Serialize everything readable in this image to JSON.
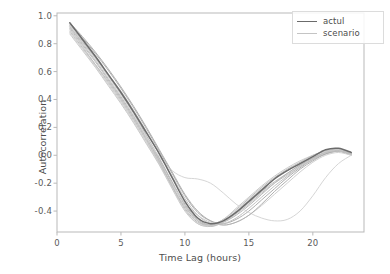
{
  "chart_data": {
    "type": "line",
    "title": "",
    "xlabel": "Time Lag (hours)",
    "ylabel": "Autocorrelation",
    "xlim": [
      0,
      24
    ],
    "ylim": [
      -0.55,
      1.02
    ],
    "xticks": [
      "0",
      "5",
      "10",
      "15",
      "20"
    ],
    "xtick_values": [
      0,
      5,
      10,
      15,
      20
    ],
    "yticks": [
      "1.0",
      "0.8",
      "0.6",
      "0.4",
      "0.2",
      "0.0",
      "-0.2",
      "-0.4"
    ],
    "ytick_values": [
      1.0,
      0.8,
      0.6,
      0.4,
      0.2,
      0.0,
      -0.2,
      -0.4
    ],
    "grid": false,
    "legend_position": "upper right",
    "legend": [
      {
        "name": "actul",
        "color": "#6b6b6b"
      },
      {
        "name": "scenario",
        "color": "#c4c4c4"
      }
    ],
    "x": [
      1,
      2,
      3,
      4,
      5,
      6,
      7,
      8,
      9,
      10,
      11,
      12,
      13,
      14,
      15,
      16,
      17,
      18,
      19,
      20,
      21,
      22,
      23
    ],
    "series": [
      {
        "name": "actul",
        "color": "#6b6b6b",
        "width": 1.5,
        "values": [
          0.95,
          0.83,
          0.71,
          0.58,
          0.45,
          0.31,
          0.16,
          0.01,
          -0.16,
          -0.33,
          -0.45,
          -0.49,
          -0.47,
          -0.41,
          -0.33,
          -0.25,
          -0.17,
          -0.11,
          -0.06,
          -0.01,
          0.04,
          0.05,
          0.02
        ]
      },
      {
        "name": "scenario",
        "color": "#bdbdbd",
        "width": 1.0,
        "values": [
          0.92,
          0.8,
          0.68,
          0.55,
          0.42,
          0.28,
          0.13,
          -0.03,
          -0.2,
          -0.36,
          -0.47,
          -0.5,
          -0.47,
          -0.41,
          -0.34,
          -0.26,
          -0.19,
          -0.13,
          -0.07,
          -0.02,
          0.02,
          0.03,
          0.01
        ]
      },
      {
        "name": "scenario",
        "color": "#b5b5b5",
        "width": 1.0,
        "values": [
          0.93,
          0.82,
          0.7,
          0.57,
          0.44,
          0.3,
          0.14,
          -0.02,
          -0.19,
          -0.35,
          -0.46,
          -0.5,
          -0.48,
          -0.43,
          -0.36,
          -0.28,
          -0.2,
          -0.13,
          -0.07,
          -0.02,
          0.02,
          0.03,
          0.0
        ]
      },
      {
        "name": "scenario",
        "color": "#c8c8c8",
        "width": 1.0,
        "values": [
          0.9,
          0.78,
          0.65,
          0.52,
          0.39,
          0.25,
          0.1,
          -0.06,
          -0.23,
          -0.39,
          -0.49,
          -0.51,
          -0.47,
          -0.4,
          -0.32,
          -0.24,
          -0.17,
          -0.11,
          -0.06,
          -0.01,
          0.03,
          0.04,
          0.01
        ]
      },
      {
        "name": "scenario",
        "color": "#aeaeae",
        "width": 1.0,
        "values": [
          0.94,
          0.84,
          0.73,
          0.61,
          0.48,
          0.34,
          0.19,
          0.03,
          -0.13,
          -0.29,
          -0.41,
          -0.47,
          -0.49,
          -0.46,
          -0.4,
          -0.32,
          -0.24,
          -0.16,
          -0.09,
          -0.03,
          0.01,
          0.03,
          0.01
        ]
      },
      {
        "name": "scenario",
        "color": "#d0d0d0",
        "width": 1.0,
        "values": [
          0.88,
          0.76,
          0.64,
          0.51,
          0.38,
          0.24,
          0.09,
          -0.06,
          -0.21,
          -0.34,
          -0.43,
          -0.48,
          -0.5,
          -0.48,
          -0.43,
          -0.36,
          -0.28,
          -0.2,
          -0.12,
          -0.05,
          0.0,
          0.02,
          0.0
        ]
      },
      {
        "name": "scenario",
        "color": "#bcbcbc",
        "width": 1.0,
        "values": [
          0.91,
          0.79,
          0.67,
          0.54,
          0.41,
          0.27,
          0.12,
          -0.04,
          -0.22,
          -0.38,
          -0.48,
          -0.5,
          -0.46,
          -0.39,
          -0.31,
          -0.23,
          -0.16,
          -0.1,
          -0.05,
          0.0,
          0.03,
          0.04,
          0.02
        ]
      },
      {
        "name": "scenario",
        "color": "#d6d6d6",
        "width": 1.0,
        "values": [
          0.93,
          0.81,
          0.69,
          0.56,
          0.43,
          0.29,
          0.13,
          -0.01,
          -0.11,
          -0.16,
          -0.17,
          -0.2,
          -0.27,
          -0.35,
          -0.41,
          -0.45,
          -0.47,
          -0.46,
          -0.4,
          -0.29,
          -0.16,
          -0.06,
          0.0
        ]
      },
      {
        "name": "scenario",
        "color": "#c0c0c0",
        "width": 1.0,
        "values": [
          0.89,
          0.77,
          0.65,
          0.53,
          0.4,
          0.26,
          0.11,
          -0.05,
          -0.22,
          -0.37,
          -0.47,
          -0.51,
          -0.48,
          -0.42,
          -0.35,
          -0.27,
          -0.2,
          -0.14,
          -0.08,
          -0.03,
          0.01,
          0.03,
          0.01
        ]
      },
      {
        "name": "scenario",
        "color": "#b0b0b0",
        "width": 1.0,
        "values": [
          0.95,
          0.85,
          0.74,
          0.62,
          0.49,
          0.35,
          0.2,
          0.04,
          -0.12,
          -0.28,
          -0.4,
          -0.47,
          -0.5,
          -0.48,
          -0.43,
          -0.35,
          -0.26,
          -0.18,
          -0.1,
          -0.04,
          0.01,
          0.03,
          0.01
        ]
      },
      {
        "name": "scenario",
        "color": "#cacaca",
        "width": 1.0,
        "values": [
          0.87,
          0.75,
          0.63,
          0.5,
          0.37,
          0.23,
          0.08,
          -0.07,
          -0.24,
          -0.4,
          -0.49,
          -0.5,
          -0.46,
          -0.38,
          -0.3,
          -0.22,
          -0.15,
          -0.09,
          -0.04,
          0.0,
          0.03,
          0.04,
          0.02
        ]
      },
      {
        "name": "scenario",
        "color": "#c2c2c2",
        "width": 1.0,
        "values": [
          0.92,
          0.81,
          0.7,
          0.58,
          0.46,
          0.32,
          0.17,
          0.01,
          -0.15,
          -0.31,
          -0.43,
          -0.49,
          -0.49,
          -0.45,
          -0.38,
          -0.3,
          -0.22,
          -0.15,
          -0.08,
          -0.03,
          0.02,
          0.03,
          0.01
        ]
      }
    ]
  },
  "axes": {
    "plot_left": 57,
    "plot_right": 364,
    "plot_top": 13,
    "plot_bottom": 232
  }
}
